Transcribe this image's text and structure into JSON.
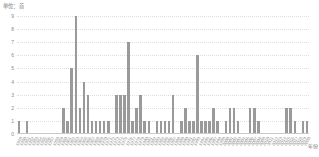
{
  "chart_data": {
    "type": "bar",
    "title": "",
    "subtitle": "",
    "unit_label": "单位：首",
    "xlabel": "年份",
    "ylabel": "",
    "ylim": [
      0,
      9
    ],
    "yticks": [
      9,
      8,
      7,
      6,
      5,
      4,
      3,
      2,
      1,
      0
    ],
    "grid": true,
    "legend": "none",
    "bar_color": "#9a9a9a",
    "grid_color": "#dedede",
    "axis_color": "#c9c9c9",
    "tick_text_color": "#8a8a8a",
    "categories": [
      "1949",
      "1950",
      "1951",
      "1952",
      "1953",
      "1954",
      "1955",
      "1956",
      "1957",
      "1958",
      "1959",
      "1960",
      "1961",
      "1962",
      "1963",
      "1964",
      "1965",
      "1966",
      "1967",
      "1968",
      "1969",
      "1970",
      "1971",
      "1972",
      "1973",
      "1974",
      "1975",
      "1976",
      "1977",
      "1978",
      "1979",
      "1980",
      "1981",
      "1982",
      "1983",
      "1984",
      "1985",
      "1986",
      "1987",
      "1988",
      "1989",
      "1990",
      "1991",
      "1992",
      "1993",
      "1994",
      "1995",
      "1996",
      "1997",
      "1998",
      "1999",
      "2000",
      "2001",
      "2002",
      "2003",
      "2004",
      "2005",
      "2006",
      "2007",
      "2008",
      "2009",
      "2010",
      "2011",
      "2012",
      "2013",
      "2014",
      "2015",
      "2016",
      "2017",
      "2018",
      "2019",
      "2020"
    ],
    "values": [
      1,
      0,
      1,
      0,
      0,
      0,
      0,
      0,
      0,
      0,
      0,
      2,
      1,
      5,
      9,
      2,
      4,
      3,
      1,
      1,
      1,
      1,
      1,
      0,
      3,
      3,
      3,
      7,
      1,
      2,
      3,
      1,
      1,
      0,
      1,
      1,
      1,
      1,
      3,
      0,
      1,
      2,
      1,
      1,
      6,
      1,
      1,
      1,
      2,
      1,
      0,
      1,
      2,
      2,
      1,
      0,
      0,
      2,
      2,
      1,
      0,
      0,
      0,
      0,
      0,
      0,
      2,
      2,
      1,
      0,
      1,
      1
    ]
  }
}
